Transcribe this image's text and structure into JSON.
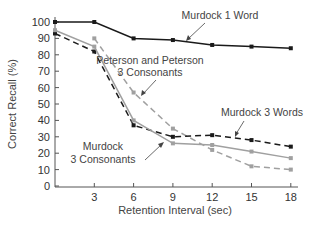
{
  "chart_data": {
    "type": "line",
    "title": "",
    "xlabel": "Retention Interval (sec)",
    "ylabel": "Correct Recall (%)",
    "xlim": [
      0,
      18
    ],
    "ylim": [
      0,
      100
    ],
    "x_ticks": [
      3,
      6,
      9,
      12,
      15,
      18
    ],
    "y_ticks": [
      0,
      10,
      20,
      30,
      40,
      50,
      60,
      70,
      80,
      90,
      100
    ],
    "grid": false,
    "legend": "inline annotations",
    "series": [
      {
        "name": "Murdock 1 Word",
        "style": "solid",
        "color": "#1a1a1a",
        "x": [
          0,
          3,
          6,
          9,
          12,
          15,
          18
        ],
        "values": [
          100,
          100,
          90,
          89,
          86,
          85,
          84
        ]
      },
      {
        "name": "Peterson and Peterson 3 Consonants",
        "style": "dashed",
        "color": "#a0a0a0",
        "x": [
          3,
          6,
          9,
          12,
          15,
          18
        ],
        "values": [
          90,
          57,
          35,
          22,
          12,
          10
        ]
      },
      {
        "name": "Murdock 3 Words",
        "style": "dashed",
        "color": "#1a1a1a",
        "x": [
          0,
          3,
          6,
          9,
          12,
          15,
          18
        ],
        "values": [
          93,
          82,
          37,
          30,
          31,
          28,
          24
        ]
      },
      {
        "name": "Murdock 3 Consonants",
        "style": "solid",
        "color": "#a0a0a0",
        "x": [
          0,
          3,
          6,
          9,
          12,
          15,
          18
        ],
        "values": [
          95,
          85,
          40,
          26,
          25,
          21,
          17
        ]
      }
    ],
    "annotations": [
      {
        "text": "Murdock 1 Word"
      },
      {
        "text_line1": "Peterson and Peterson",
        "text_line2": "3 Consonants"
      },
      {
        "text": "Murdock 3 Words"
      },
      {
        "text_line1": "Murdock",
        "text_line2": "3 Consonants"
      }
    ]
  },
  "labels": {
    "x_axis": "Retention Interval (sec)",
    "y_axis": "Correct Recall (%)",
    "y_ticks": [
      "0",
      "10",
      "20",
      "30",
      "40",
      "50",
      "60",
      "70",
      "80",
      "90",
      "100"
    ],
    "x_ticks": [
      "3",
      "6",
      "9",
      "12",
      "15",
      "18"
    ],
    "ann_1word": "Murdock 1 Word",
    "ann_peterson_1": "Peterson and Peterson",
    "ann_peterson_2": "3 Consonants",
    "ann_3words": "Murdock 3 Words",
    "ann_3cons_1": "Murdock",
    "ann_3cons_2": "3 Consonants"
  }
}
